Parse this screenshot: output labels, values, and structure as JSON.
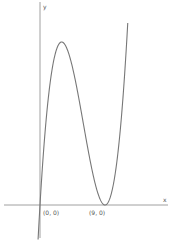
{
  "chart_data": {
    "type": "line",
    "title": "",
    "xlabel": "x",
    "ylabel": "y",
    "function_shape": "cubic y = k·x·(x−9)², double root at x=9, local max at x=3",
    "points": [
      {
        "label": "(0, 0)",
        "x": 0,
        "y": 0
      },
      {
        "label": "(9, 0)",
        "x": 9,
        "y": 0
      }
    ],
    "grid": false,
    "colors": {
      "curve": "#777777",
      "axis": "#888888"
    }
  },
  "labels": {
    "x_axis": "x",
    "y_axis": "y",
    "origin": "(0, 0)",
    "root": "(9, 0)"
  }
}
